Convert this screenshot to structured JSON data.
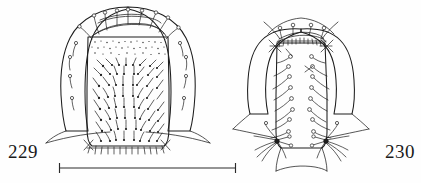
{
  "plate": {
    "type": "scientific-line-drawing",
    "background_color": "#fefefe",
    "ink_color": "#1d1d1d",
    "figures": [
      {
        "number": "229",
        "label_position": "bottom-left",
        "subject": "dorsal view of head capsule with setose median sclerite",
        "description": "rounded head capsule with broad lateral lobes, inner rectangular median plate bearing dense stout setae and stippling, fringe of short setae along posterior margin",
        "seta_style": "stout-clavate",
        "bounds": {
          "x": 60,
          "y": 6,
          "width": 138,
          "height": 142
        }
      },
      {
        "number": "230",
        "label_position": "bottom-right",
        "subject": "dorsal view of head capsule with long curved setae",
        "description": "narrower head capsule with rounded lateral lobes, median plate bearing long curved setae arising from ringed alveoli, dense setal tufts at posterior angles",
        "seta_style": "long-curved",
        "bounds": {
          "x": 246,
          "y": 16,
          "width": 112,
          "height": 150
        }
      }
    ],
    "scale_bar": {
      "present": true,
      "orientation": "horizontal",
      "end_ticks": true,
      "label": "",
      "x_start": 59,
      "x_end": 236,
      "y": 168
    }
  },
  "labels": {
    "fig_left": "229",
    "fig_right": "230"
  },
  "colors": {
    "ink": "#1d1d1d",
    "paper": "#fefefe",
    "label_text": "#1a1a1a"
  }
}
